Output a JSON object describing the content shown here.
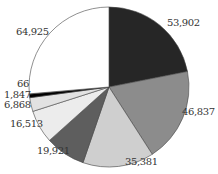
{
  "chart_data": {
    "type": "pie",
    "title": "",
    "start_angle": "12 o'clock",
    "direction": "clockwise",
    "legend": "none",
    "slices": [
      {
        "label": "53,902",
        "value": 53902,
        "fill": "#262626"
      },
      {
        "label": "46,837",
        "value": 46837,
        "fill": "#8c8c8c"
      },
      {
        "label": "35,381",
        "value": 35381,
        "fill": "#cfcfcf"
      },
      {
        "label": "19,921",
        "value": 19921,
        "fill": "#5e5e5e"
      },
      {
        "label": "16,513",
        "value": 16513,
        "fill": "#ececec"
      },
      {
        "label": "6,868",
        "value": 6868,
        "fill": "#e2e2e2"
      },
      {
        "label": "1,847",
        "value": 1847,
        "fill": "#000000"
      },
      {
        "label": "66",
        "value": 66,
        "fill": "#9a9a9a"
      },
      {
        "label": "64,925",
        "value": 64925,
        "fill": "#ffffff"
      }
    ]
  },
  "labels": {
    "l0": "53,902",
    "l1": "46,837",
    "l2": "35,381",
    "l3": "19,921",
    "l4": "16,513",
    "l5": "6,868",
    "l6": "1,847",
    "l7": "66",
    "l8": "64,925"
  }
}
